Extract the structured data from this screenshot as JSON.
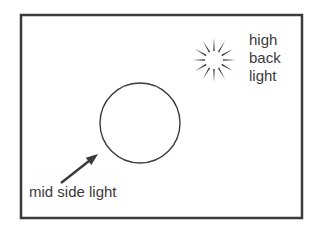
{
  "diagram": {
    "background_color": "#ffffff",
    "stroke_color": "#3a3a3a",
    "frame": {
      "name": "outer-frame",
      "x": 21,
      "y": 15,
      "width": 281,
      "height": 203,
      "stroke_width": 2.5
    },
    "subject": {
      "name": "subject-circle",
      "cx": 140,
      "cy": 123,
      "r": 40,
      "stroke_width": 1.4
    },
    "light_sources": [
      {
        "id": "high-back-light",
        "icon": "sun-burst-icon",
        "cx": 214,
        "cy": 60,
        "inner_radius": 9,
        "outer_radius": 22,
        "ray_count": 12,
        "label_lines": [
          "high",
          "back",
          "light"
        ]
      },
      {
        "id": "mid-side-light",
        "icon": "arrow-icon",
        "arrow": {
          "x1": 61,
          "y1": 183,
          "x2": 98,
          "y2": 154,
          "stroke_width": 2.4,
          "head_length": 12,
          "head_width": 9
        },
        "label_lines": [
          "mid side light"
        ]
      }
    ]
  },
  "labels": {
    "back_light": {
      "line1": "high",
      "line2": "back",
      "line3": "light"
    },
    "side_light": {
      "line1": "mid side light"
    }
  }
}
